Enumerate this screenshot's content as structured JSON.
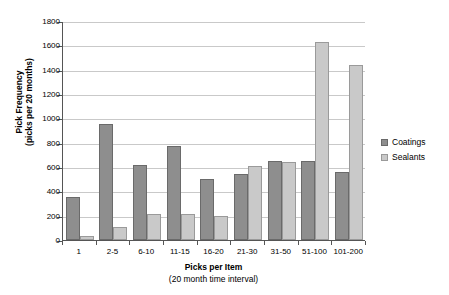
{
  "chart_data": {
    "type": "bar",
    "title": "",
    "xlabel": "Picks per Item",
    "xlabel_sub": "(20 month time interval)",
    "ylabel": "Pick Frequency",
    "ylabel_sub": "(picks per 20 months)",
    "categories": [
      "1",
      "2-5",
      "6-10",
      "11-15",
      "16-20",
      "21-30",
      "31-50",
      "51-100",
      "101-200"
    ],
    "series": [
      {
        "name": "Coatings",
        "color": "#8e8e8e",
        "values": [
          350,
          955,
          620,
          775,
          500,
          540,
          650,
          650,
          560
        ]
      },
      {
        "name": "Sealants",
        "color": "#c9c9c9",
        "values": [
          30,
          110,
          210,
          215,
          200,
          610,
          645,
          1630,
          1440
        ]
      }
    ],
    "ylim": [
      0,
      1800
    ],
    "ytick_step": 200,
    "yticks": [
      0,
      200,
      400,
      600,
      800,
      1000,
      1200,
      1400,
      1600,
      1800
    ],
    "grid": true,
    "legend_position": "right"
  },
  "legend": {
    "entries": [
      {
        "label": "Coatings",
        "swatch": "coatings"
      },
      {
        "label": "Sealants",
        "swatch": "sealants"
      }
    ]
  }
}
